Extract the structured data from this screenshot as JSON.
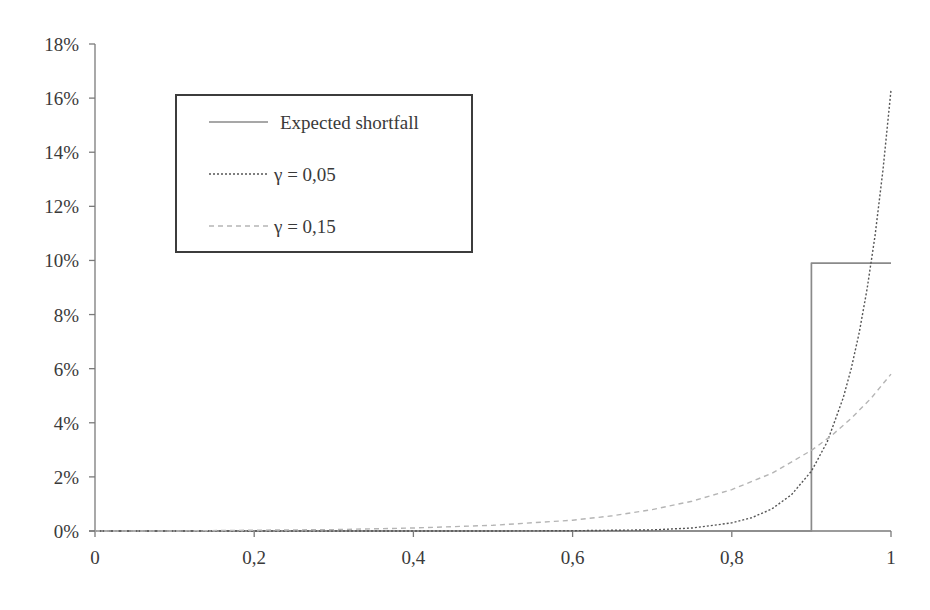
{
  "chart_data": {
    "type": "line",
    "title": "",
    "xlabel": "",
    "ylabel": "",
    "xlim": [
      0,
      1
    ],
    "ylim": [
      0,
      18
    ],
    "grid": false,
    "legend_position": "upper-left (inset, boxed)",
    "x_ticks": [
      "0",
      "0,2",
      "0,4",
      "0,6",
      "0,8",
      "1"
    ],
    "x_tick_values": [
      0,
      0.2,
      0.4,
      0.6,
      0.8,
      1.0
    ],
    "y_ticks": [
      "0%",
      "2%",
      "4%",
      "6%",
      "8%",
      "10%",
      "12%",
      "14%",
      "16%",
      "18%"
    ],
    "y_tick_values": [
      0,
      2,
      4,
      6,
      8,
      10,
      12,
      14,
      16,
      18
    ],
    "series": [
      {
        "name": "Expected shortfall",
        "style": "solid",
        "color": "#8a8a8a",
        "x": [
          0,
          0.9,
          0.9,
          0.9,
          1.0
        ],
        "y": [
          0,
          0,
          0,
          9.9,
          9.9
        ]
      },
      {
        "name": "γ = 0,05",
        "style": "dotted",
        "color": "#555555",
        "x": [
          0,
          0.5,
          0.6,
          0.7,
          0.75,
          0.8,
          0.825,
          0.85,
          0.875,
          0.9,
          0.92,
          0.94,
          0.95,
          0.96,
          0.97,
          0.98,
          0.99,
          1.0
        ],
        "y": [
          0,
          0.0,
          0.01,
          0.04,
          0.11,
          0.3,
          0.49,
          0.81,
          1.34,
          2.21,
          3.3,
          4.92,
          6.0,
          7.33,
          8.95,
          10.93,
          13.35,
          16.3
        ]
      },
      {
        "name": "γ = 0,15",
        "style": "dashed",
        "color": "#b5b5b5",
        "x": [
          0,
          0.1,
          0.2,
          0.3,
          0.4,
          0.5,
          0.6,
          0.65,
          0.7,
          0.75,
          0.8,
          0.85,
          0.9,
          0.925,
          0.95,
          0.975,
          1.0
        ],
        "y": [
          0.0,
          0.0,
          0.03,
          0.05,
          0.11,
          0.21,
          0.4,
          0.56,
          0.79,
          1.1,
          1.53,
          2.13,
          2.98,
          3.52,
          4.16,
          4.91,
          5.8
        ]
      }
    ]
  },
  "legend": {
    "items": [
      {
        "label": "Expected shortfall"
      },
      {
        "label": "γ = 0,05"
      },
      {
        "label": "γ = 0,15"
      }
    ]
  }
}
